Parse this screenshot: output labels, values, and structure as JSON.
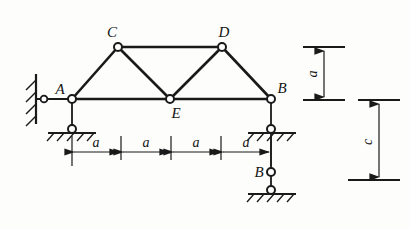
{
  "figure": {
    "type": "truss-structural-diagram",
    "title": "",
    "background_color": "#fdfdfb",
    "line_color": "#1a1a1a"
  },
  "joints": [
    {
      "id": "A",
      "label": "A",
      "x": 72,
      "y": 99,
      "label_x": 60,
      "label_y": 93
    },
    {
      "id": "C",
      "label": "C",
      "x": 118,
      "y": 47,
      "label_x": 110,
      "label_y": 38
    },
    {
      "id": "D",
      "label": "D",
      "x": 222,
      "y": 47,
      "label_x": 222,
      "label_y": 38
    },
    {
      "id": "E",
      "label": "E",
      "x": 170,
      "y": 99,
      "label_x": 174,
      "label_y": 117
    },
    {
      "id": "B",
      "label": "B",
      "x": 271,
      "y": 99,
      "label_x": 278,
      "label_y": 93
    },
    {
      "id": "Blink",
      "label": "B",
      "x": 271,
      "y": 172,
      "label_x": 258,
      "label_y": 176
    }
  ],
  "members": [
    {
      "from": "A",
      "to": "E",
      "kind": "bottom-chord"
    },
    {
      "from": "E",
      "to": "B",
      "kind": "bottom-chord"
    },
    {
      "from": "C",
      "to": "D",
      "kind": "top-chord"
    },
    {
      "from": "A",
      "to": "C",
      "kind": "diagonal"
    },
    {
      "from": "C",
      "to": "E",
      "kind": "diagonal"
    },
    {
      "from": "E",
      "to": "D",
      "kind": "diagonal"
    },
    {
      "from": "D",
      "to": "B",
      "kind": "diagonal"
    }
  ],
  "supports": {
    "left_wall": {
      "label": "wall-hatched",
      "x": 36,
      "y_top": 74,
      "y_bottom": 124,
      "pin_x": 44,
      "pin_y": 99
    },
    "left_pin": {
      "label": "pin-support-under-A",
      "x": 72,
      "y": 129
    },
    "right_pin": {
      "label": "pin-support-under-B",
      "x": 271,
      "y": 129
    },
    "bottom_pin": {
      "label": "ground-pin-lower",
      "x": 271,
      "y": 190
    }
  },
  "dimensions": {
    "horizontal": {
      "label": "a",
      "count": 4,
      "segments": [
        {
          "label": "a",
          "from_x": 72,
          "to_x": 121
        },
        {
          "label": "a",
          "from_x": 121,
          "to_x": 171
        },
        {
          "label": "a",
          "from_x": 171,
          "to_x": 221
        },
        {
          "label": "a",
          "from_x": 221,
          "to_x": 271
        }
      ],
      "line_y": 147
    },
    "vertical_a": {
      "label": "a",
      "x": 322,
      "from_y": 47,
      "to_y": 99,
      "label_x": 315,
      "label_y": 73
    },
    "vertical_c": {
      "label": "c",
      "x": 378,
      "from_y": 100,
      "to_y": 180,
      "label_x": 371,
      "label_y": 142
    }
  },
  "labels": {
    "a": "a",
    "c": "c",
    "A": "A",
    "B": "B",
    "C": "C",
    "D": "D",
    "E": "E"
  }
}
